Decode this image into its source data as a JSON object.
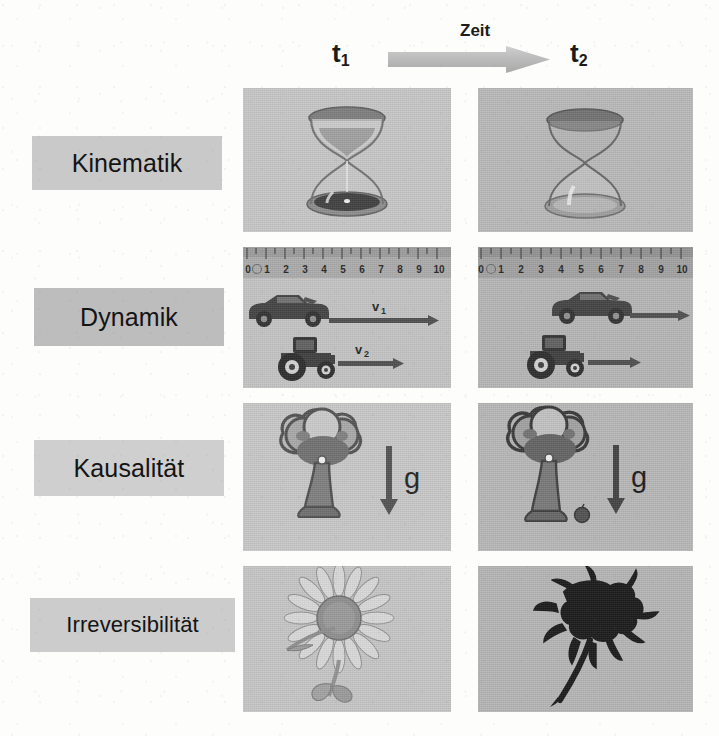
{
  "header": {
    "t1_label": "t",
    "t1_sub": "1",
    "t2_label": "t",
    "t2_sub": "2",
    "time_caption": "Zeit",
    "arrow_icon": "right-arrow-icon"
  },
  "rows": [
    {
      "id": "kinematik",
      "label": "Kinematik",
      "label_bg": "#c9c9c9",
      "t1": {
        "scene": "hourglass-full",
        "description": "Sanduhr mit Sand, oben gefuellt, unten gefuellt",
        "icon": "hourglass-icon"
      },
      "t2": {
        "scene": "hourglass-empty",
        "description": "Sanduhr leer",
        "icon": "hourglass-icon"
      }
    },
    {
      "id": "dynamik",
      "label": "Dynamik",
      "label_bg": "#bdbdbd",
      "ruler": {
        "ticks": [
          "0",
          "1",
          "2",
          "3",
          "4",
          "5",
          "6",
          "7",
          "8",
          "9",
          "10"
        ],
        "icon": "ruler-icon"
      },
      "t1": {
        "scene": "car-and-tractor-start",
        "car_label": "v",
        "car_label_sub": "1",
        "car_position": 0.5,
        "tractor_label": "v",
        "tractor_label_sub": "2",
        "tractor_position": 1.0,
        "icons": [
          "car-icon",
          "tractor-icon",
          "velocity-arrow-icon"
        ]
      },
      "t2": {
        "scene": "car-and-tractor-moved",
        "car_position": 4.5,
        "tractor_position": 2.0,
        "icons": [
          "car-icon",
          "tractor-icon",
          "velocity-arrow-icon"
        ]
      }
    },
    {
      "id": "kausalitaet",
      "label": "Kausalität",
      "label_bg": "#cfcfcf",
      "t1": {
        "scene": "tree-with-apple",
        "gravity_label": "g",
        "icons": [
          "tree-icon",
          "apple-icon",
          "down-arrow-icon"
        ]
      },
      "t2": {
        "scene": "tree-apple-fallen",
        "gravity_label": "g",
        "icons": [
          "tree-icon",
          "apple-icon",
          "down-arrow-icon"
        ]
      }
    },
    {
      "id": "irreversibilitaet",
      "label": "Irreversibilität",
      "label_bg": "#cccccc",
      "t1": {
        "scene": "fresh-sunflower",
        "icon": "flower-icon"
      },
      "t2": {
        "scene": "withered-flower",
        "icon": "withered-flower-icon"
      }
    }
  ],
  "colors": {
    "page_bg": "#fdfdfc",
    "panel_light": "#c5c5c5",
    "panel_dark": "#b6b6b6",
    "label_chip": "#c9c9c9",
    "ink": "#1b1b1b",
    "arrow": "#b9b9b9"
  }
}
